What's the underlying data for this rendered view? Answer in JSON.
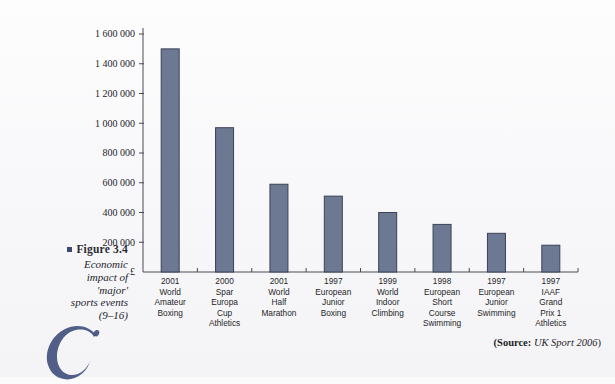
{
  "figure": {
    "number_label": "Figure 3.4",
    "caption_lines": [
      "Economic",
      "impact of",
      "'major'",
      "sports events",
      "(9–16)"
    ]
  },
  "source": {
    "label": "(Source:",
    "value": "UK Sport 2006",
    "close": ")"
  },
  "dropcap": {
    "letter": "C"
  },
  "colors": {
    "bar_fill": "#6d7993",
    "bar_stroke": "#3a4256",
    "axis": "#4a4a55",
    "caption_bullet": "#3c4a70",
    "dropcap": "#41507e",
    "page_background": "#fbfbfb"
  },
  "chart_data": {
    "type": "bar",
    "title": "",
    "xlabel": "",
    "ylabel": "£",
    "ylim": [
      0,
      1600000
    ],
    "grid": false,
    "legend": false,
    "currency_symbol": "£",
    "ytick_labels": [
      "200 000",
      "400 000",
      "600 000",
      "800 000",
      "1 000 000",
      "1 200 000",
      "1 400 000",
      "1 600 000"
    ],
    "ytick_values": [
      200000,
      400000,
      600000,
      800000,
      1000000,
      1200000,
      1400000,
      1600000
    ],
    "categories": [
      "2001 World Amateur Boxing",
      "2000 Spar Europa Cup Athletics",
      "2001 World Half Marathon",
      "1997 European Junior Boxing",
      "1999 World Indoor Climbing",
      "1998 European Short Course Swimming",
      "1997 European Junior Swimming",
      "1997 IAAF Grand Prix 1 Athletics"
    ],
    "category_lines": [
      [
        "2001",
        "World",
        "Amateur",
        "Boxing"
      ],
      [
        "2000",
        "Spar",
        "Europa",
        "Cup",
        "Athletics"
      ],
      [
        "2001",
        "World",
        "Half",
        "Marathon"
      ],
      [
        "1997",
        "European",
        "Junior",
        "Boxing"
      ],
      [
        "1999",
        "World",
        "Indoor",
        "Climbing"
      ],
      [
        "1998",
        "European",
        "Short",
        "Course",
        "Swimming"
      ],
      [
        "1997",
        "European",
        "Junior",
        "Swimming"
      ],
      [
        "1997",
        "IAAF",
        "Grand",
        "Prix 1",
        "Athletics"
      ]
    ],
    "values": [
      1500000,
      970000,
      590000,
      510000,
      400000,
      320000,
      260000,
      180000
    ]
  }
}
